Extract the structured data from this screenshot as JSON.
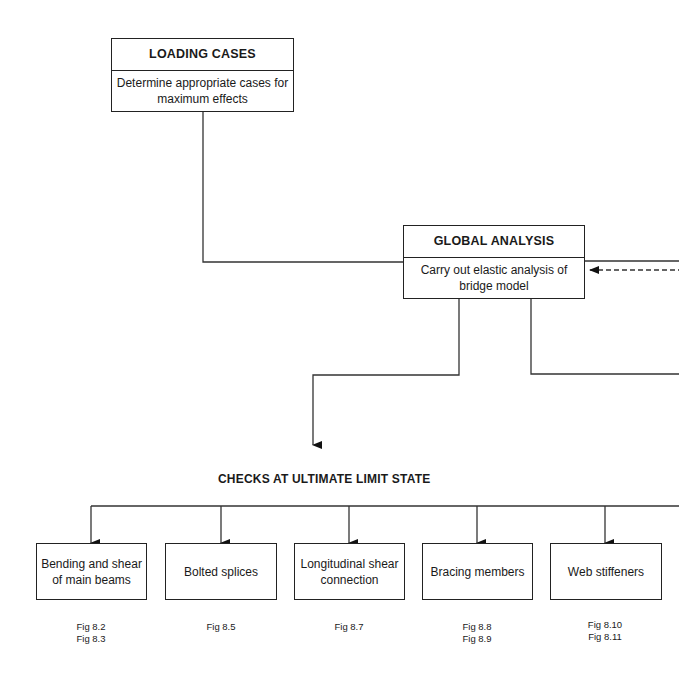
{
  "loading_cases": {
    "title": "LOADING CASES",
    "description": "Determine appropriate cases for maximum effects"
  },
  "global_analysis": {
    "title": "GLOBAL ANALYSIS",
    "description": "Carry out elastic analysis of bridge model"
  },
  "section_title": "CHECKS AT ULTIMATE LIMIT STATE",
  "checks": [
    {
      "label": "Bending and shear of main beams",
      "figs": [
        "Fig 8.2",
        "Fig 8.3"
      ]
    },
    {
      "label": "Bolted splices",
      "figs": [
        "Fig 8.5"
      ]
    },
    {
      "label": "Longitudinal shear connection",
      "figs": [
        "Fig 8.7"
      ]
    },
    {
      "label": "Bracing members",
      "figs": [
        "Fig 8.8",
        "Fig 8.9"
      ]
    },
    {
      "label": "Web stiffeners",
      "figs": [
        "Fig 8.10",
        "Fig 8.11"
      ]
    }
  ]
}
